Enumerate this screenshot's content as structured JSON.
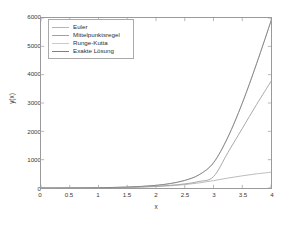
{
  "chart_data": {
    "type": "line",
    "title": "",
    "xlabel": "x",
    "ylabel": "y(x)",
    "xlim": [
      0,
      4
    ],
    "ylim": [
      0,
      6000
    ],
    "grid": false,
    "legend_position": "upper left",
    "xticks": [
      "0",
      "0.5",
      "1",
      "1.5",
      "2",
      "2.5",
      "3",
      "3.5",
      "4"
    ],
    "xtick_values": [
      0,
      0.5,
      1,
      1.5,
      2,
      2.5,
      3,
      3.5,
      4
    ],
    "yticks": [
      "0",
      "1000",
      "2000",
      "3000",
      "4000",
      "5000",
      "6000"
    ],
    "ytick_values": [
      0,
      1000,
      2000,
      3000,
      4000,
      5000,
      6000
    ],
    "x": [
      0,
      0.25,
      0.5,
      0.75,
      1,
      1.25,
      1.5,
      1.75,
      2,
      2.25,
      2.5,
      2.75,
      3,
      3.25,
      3.5,
      3.75,
      4
    ],
    "series": [
      {
        "name": "Euler",
        "color": "#b4b4b4",
        "values": [
          0,
          1,
          2,
          4,
          7,
          12,
          20,
          32,
          50,
          78,
          120,
          180,
          260,
          350,
          430,
          500,
          555
        ]
      },
      {
        "name": "Mittelpunktsregel",
        "color": "#a0a0a0",
        "values": [
          0,
          1,
          2,
          4,
          8,
          14,
          24,
          40,
          62,
          95,
          145,
          230,
          400,
          1250,
          2100,
          2950,
          3760
        ]
      },
      {
        "name": "Runge-Kutta",
        "color": "#cacaca",
        "values": [
          0,
          1,
          3,
          6,
          11,
          19,
          33,
          56,
          94,
          158,
          268,
          470,
          900,
          1800,
          3000,
          4400,
          5900
        ]
      },
      {
        "name": "Exakte Lösung",
        "color": "#808080",
        "values": [
          0,
          1,
          3,
          6,
          11,
          19,
          33,
          56,
          94,
          158,
          268,
          468,
          890,
          1790,
          2990,
          4390,
          5890
        ]
      }
    ],
    "legend_entries": [
      {
        "label": "Euler",
        "color": "#b4b4b4"
      },
      {
        "label": "Mittelpunktsregel",
        "color": "#a0a0a0"
      },
      {
        "label": "Runge-Kutta",
        "color": "#cacaca"
      },
      {
        "label": "Exakte Lösung",
        "color": "#808080"
      }
    ],
    "axis_color": "#9a9a9a",
    "background_color": "#ffffff"
  }
}
